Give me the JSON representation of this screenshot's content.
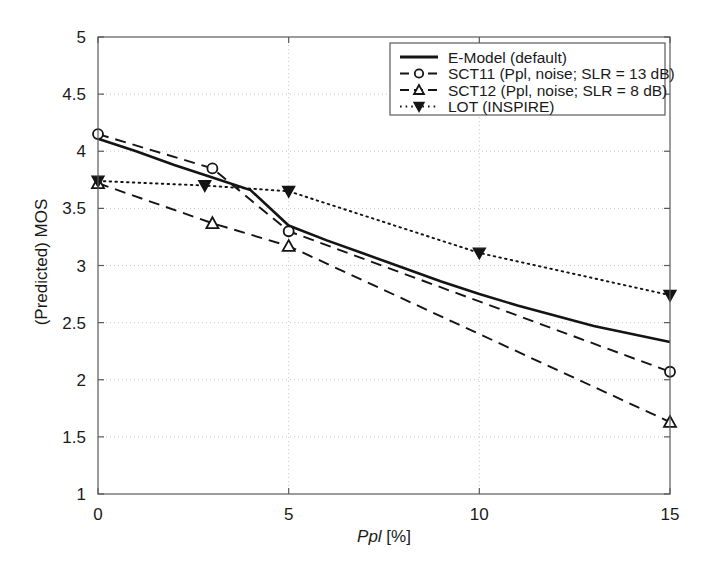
{
  "chart_data": {
    "type": "line",
    "title": "",
    "xlabel": "Ppl [%]",
    "xlabel_italic_part": "Ppl",
    "xlabel_plain_part": " [%]",
    "ylabel": "(Predicted) MOS",
    "xlim": [
      0,
      15
    ],
    "ylim": [
      1,
      5
    ],
    "xticks": [
      0,
      5,
      10,
      15
    ],
    "xtick_labels": [
      "0",
      "5",
      "10",
      "15"
    ],
    "yticks": [
      1,
      1.5,
      2,
      2.5,
      3,
      3.5,
      4,
      4.5,
      5
    ],
    "ytick_labels": [
      "1",
      "1.5",
      "2",
      "2.5",
      "3",
      "3.5",
      "4",
      "4.5",
      "5"
    ],
    "grid": true,
    "grid_style": "dotted",
    "grid_color": "#c8c8c8",
    "legend_position": "top-right",
    "series": [
      {
        "name": "E-Model (default)",
        "label": "E-Model (default)",
        "style": "solid",
        "marker": "none",
        "color": "#141414",
        "x": [
          0,
          1,
          2,
          3,
          4,
          5,
          6,
          7,
          8,
          9,
          10,
          11,
          12,
          13,
          14,
          15
        ],
        "y": [
          4.11,
          4.0,
          3.88,
          3.77,
          3.66,
          3.35,
          3.22,
          3.1,
          2.98,
          2.86,
          2.75,
          2.65,
          2.56,
          2.47,
          2.4,
          2.33
        ]
      },
      {
        "name": "SCT11 (Ppl, noise; SLR = 13 dB)",
        "label": "SCT11 (Ppl, noise; SLR = 13 dB)",
        "style": "dashed",
        "marker": "circle",
        "color": "#141414",
        "x": [
          0,
          3,
          5,
          15
        ],
        "y": [
          4.15,
          3.85,
          3.3,
          2.07
        ]
      },
      {
        "name": "SCT12 (Ppl, noise; SLR = 8 dB)",
        "label": "SCT12 (Ppl, noise; SLR = 8 dB)",
        "style": "dashed",
        "marker": "triangle-up",
        "color": "#141414",
        "x": [
          0,
          3,
          5,
          15
        ],
        "y": [
          3.72,
          3.37,
          3.17,
          1.63
        ]
      },
      {
        "name": "LOT (INSPIRE)",
        "label": "LOT (INSPIRE)",
        "style": "dotted",
        "marker": "triangle-down",
        "color": "#141414",
        "x": [
          0,
          2.8,
          5,
          10,
          15
        ],
        "y": [
          3.74,
          3.7,
          3.65,
          3.11,
          2.74
        ]
      }
    ]
  },
  "legend": {
    "entries": [
      {
        "label": "E-Model (default)",
        "style": "solid",
        "marker": "none"
      },
      {
        "label": "SCT11 (Ppl, noise; SLR = 13 dB)",
        "style": "dashed",
        "marker": "circle"
      },
      {
        "label": "SCT12 (Ppl, noise; SLR = 8 dB)",
        "style": "dashed",
        "marker": "triangle-up"
      },
      {
        "label": "LOT (INSPIRE)",
        "style": "dotted",
        "marker": "triangle-down"
      }
    ]
  },
  "axes": {
    "x_title_italic": "Ppl",
    "x_title_rest": " [%]",
    "y_title": "(Predicted) MOS"
  }
}
